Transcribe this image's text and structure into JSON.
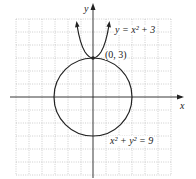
{
  "figure": {
    "axes": {
      "x_label": "x",
      "y_label": "y",
      "x_range": [
        -6,
        6
      ],
      "y_range": [
        -6,
        6
      ],
      "grid": true
    },
    "curves": [
      {
        "name": "parabola",
        "equation": "y = x² + 3",
        "label": "y = x² + 3"
      },
      {
        "name": "circle",
        "equation": "x² + y² = 9",
        "label": "x² + y² = 9"
      }
    ],
    "point": {
      "label": "(0, 3)",
      "x": 0,
      "y": 3
    },
    "colors": {
      "curve": "#222222",
      "grid": "#bbbbbb",
      "axis": "#222222"
    }
  }
}
